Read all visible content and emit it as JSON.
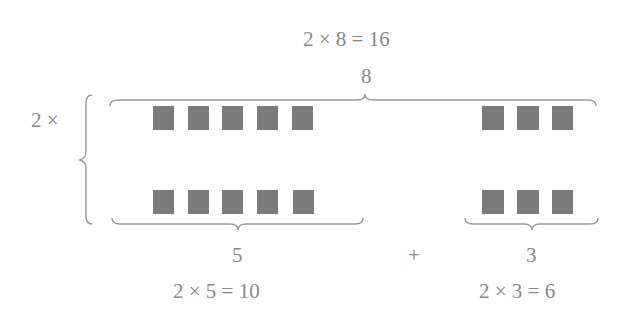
{
  "diagram": {
    "top_equation": "2 × 8 = 16",
    "top_total": "8",
    "row_multiplier": "2 ×",
    "left_group_count": "5",
    "right_group_count": "3",
    "plus_sign": "+",
    "left_equation": "2 × 5 = 10",
    "right_equation": "2 × 3 = 6",
    "rows": 2,
    "left_squares_per_row": 5,
    "right_squares_per_row": 3,
    "square_color": "#7b7b7b",
    "text_color": "#8a8a8a"
  }
}
